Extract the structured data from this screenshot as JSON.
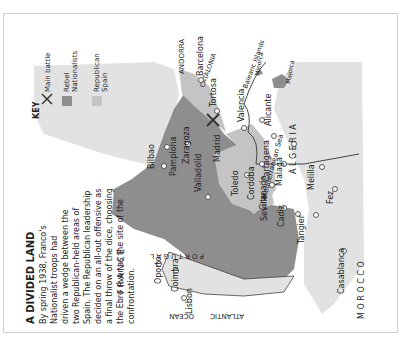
{
  "title": "A DIVIDED LAND",
  "body_text_lines": [
    "By spring 1938, Franco's",
    "Nationalist troops had",
    "driven a wedge between the",
    "two Republican-held areas of",
    "Spain. The Republican leadership",
    "decided on an all-out offensive as",
    "a final throw of the dice, choosing",
    "the Ebro river as the site of the",
    "confrontation."
  ],
  "key": {
    "heading": "KEY",
    "items": [
      {
        "icon": "x-icon",
        "label_lines": [
          "Main battle"
        ]
      },
      {
        "icon": "swatch-dark",
        "label_lines": [
          "Rebel",
          "Nationalists"
        ],
        "color": "#8e8e8e"
      },
      {
        "icon": "swatch-light",
        "label_lines": [
          "Republican",
          "Spain"
        ],
        "color": "#c4c4c4"
      }
    ]
  },
  "regions": {
    "france": "F R A N C E",
    "andorra": "ANDORRA",
    "catalonia": "CATALONIA",
    "portugal": "P O R T U G A L",
    "algeria": "A L G E R I A",
    "morocco": "M O R O C C O",
    "atlantic": "ATLANTIC",
    "ocean": "OCEAN",
    "mediterranean": "Mediterranean Sea",
    "balearic": "Balearic Islands",
    "minorca": "Minorca",
    "majorca": "Majorca"
  },
  "cities": [
    "Barcelona",
    "Tortosa",
    "Valencia",
    "Alicante",
    "Cartagena",
    "Malaga",
    "Granada",
    "Cordoba",
    "Seville",
    "Cadiz",
    "Madrid",
    "Toledo",
    "Valladolid",
    "Zaragoza",
    "Pamplona",
    "Bilbao",
    "Oporto",
    "Coimbra",
    "Lisbon",
    "Tangier",
    "Melilla",
    "Fez",
    "Casablanca"
  ],
  "colors": {
    "land_foreign": "#e2e2e2",
    "nationalist": "#8e8e8e",
    "republican": "#c4c4c4",
    "sea": "#ffffff",
    "text": "#222222"
  }
}
